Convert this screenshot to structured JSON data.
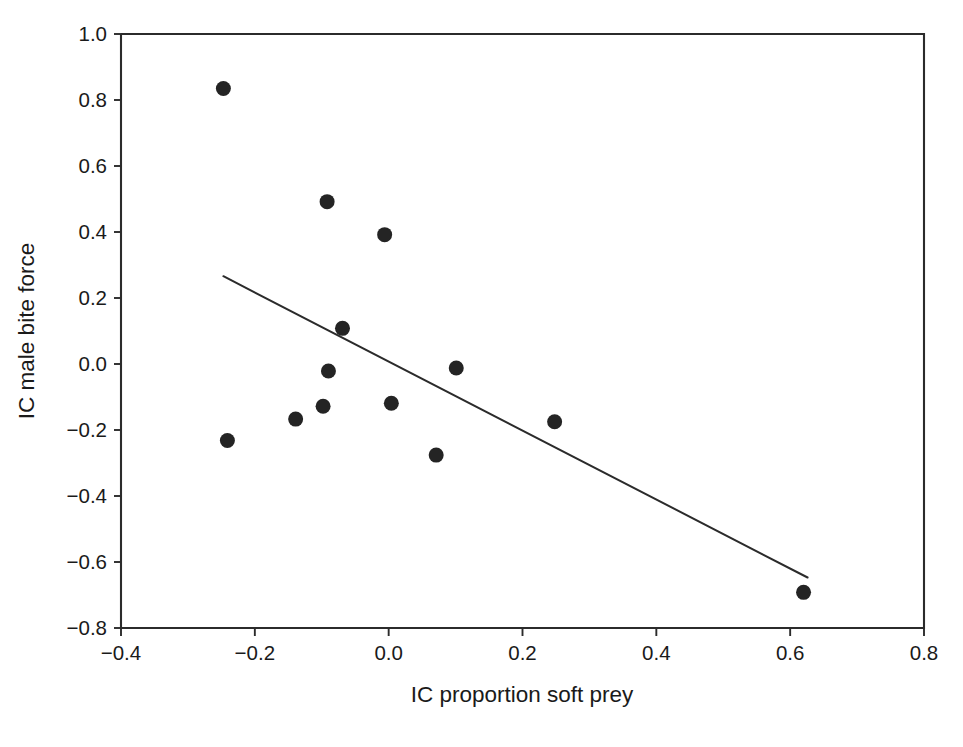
{
  "chart_data": {
    "type": "scatter",
    "title": "",
    "xlabel": "IC proportion soft prey",
    "ylabel": "IC male bite force",
    "xlim": [
      -0.4,
      0.8
    ],
    "ylim": [
      -0.8,
      1.0
    ],
    "xticks": [
      "-0.4",
      "-0.2",
      "0.0",
      "0.2",
      "0.4",
      "0.6",
      "0.8"
    ],
    "xtick_values": [
      -0.4,
      -0.2,
      0.0,
      0.2,
      0.4,
      0.6,
      0.8
    ],
    "yticks": [
      "1.0",
      "0.8",
      "0.6",
      "0.4",
      "0.2",
      "0.0",
      "-0.2",
      "-0.4",
      "-0.6",
      "-0.8"
    ],
    "ytick_values": [
      1.0,
      0.8,
      0.6,
      0.4,
      0.2,
      0.0,
      -0.2,
      -0.4,
      -0.6,
      -0.8
    ],
    "grid": false,
    "legend": "none",
    "marker": "filled-circle",
    "marker_color": "#242424",
    "marker_size_px": 15,
    "points": [
      {
        "x": -0.247,
        "y": 0.835
      },
      {
        "x": -0.092,
        "y": 0.492
      },
      {
        "x": -0.006,
        "y": 0.392
      },
      {
        "x": -0.069,
        "y": 0.108
      },
      {
        "x": -0.09,
        "y": -0.021
      },
      {
        "x": 0.101,
        "y": -0.012
      },
      {
        "x": -0.098,
        "y": -0.128
      },
      {
        "x": 0.004,
        "y": -0.119
      },
      {
        "x": -0.139,
        "y": -0.167
      },
      {
        "x": 0.248,
        "y": -0.175
      },
      {
        "x": -0.241,
        "y": -0.232
      },
      {
        "x": 0.071,
        "y": -0.276
      },
      {
        "x": 0.62,
        "y": -0.692
      }
    ],
    "trend_line": {
      "type": "linear-fit",
      "x_start": -0.247,
      "y_start": 0.266,
      "x_end": 0.626,
      "y_end": -0.647,
      "color": "#2b2b2b"
    }
  },
  "axes": {
    "x_axis_label": "IC proportion soft prey",
    "y_axis_label": "IC male bite force",
    "frame_color": "#2b2b2b"
  },
  "caption": {
    "partial_text": ""
  }
}
